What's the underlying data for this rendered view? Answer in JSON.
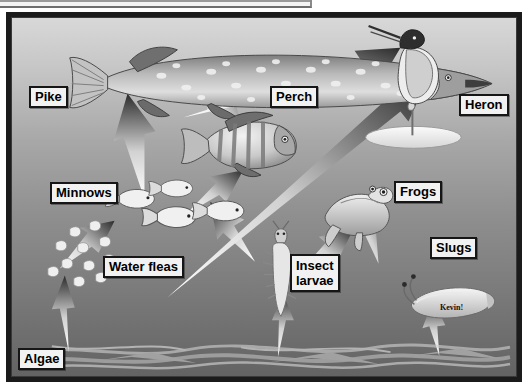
{
  "diagram": {
    "signature": "Kevin!",
    "background": {
      "water_top_color": "#d8d8d8",
      "water_bottom_color": "#636363",
      "frame_color": "#1b1b1b"
    },
    "organisms": [
      {
        "id": "pike",
        "label": "Pike",
        "x": 29,
        "y": 86,
        "role": "top predator fish"
      },
      {
        "id": "perch",
        "label": "Perch",
        "x": 270,
        "y": 86,
        "role": "predator fish"
      },
      {
        "id": "heron",
        "label": "Heron",
        "x": 459,
        "y": 94,
        "role": "bird predator"
      },
      {
        "id": "minnows",
        "label": "Minnows",
        "x": 50,
        "y": 182,
        "role": "small fish"
      },
      {
        "id": "frogs",
        "label": "Frogs",
        "x": 394,
        "y": 181,
        "role": "amphibian"
      },
      {
        "id": "water-fleas",
        "label": "Water fleas",
        "x": 103,
        "y": 256,
        "role": "zooplankton"
      },
      {
        "id": "insect-larvae",
        "label": "Insect\nlarvae",
        "x": 290,
        "y": 254,
        "role": "invertebrate"
      },
      {
        "id": "slugs",
        "label": "Slugs",
        "x": 430,
        "y": 237,
        "role": "invertebrate"
      },
      {
        "id": "algae",
        "label": "Algae",
        "x": 18,
        "y": 348,
        "role": "producer"
      }
    ],
    "arrows": [
      {
        "from": "algae",
        "to": "water-fleas"
      },
      {
        "from": "water-fleas",
        "to": "minnows"
      },
      {
        "from": "minnows",
        "to": "pike"
      },
      {
        "from": "minnows",
        "to": "perch"
      },
      {
        "from": "perch",
        "to": "pike"
      },
      {
        "from": "perch",
        "to": "heron"
      },
      {
        "from": "algae",
        "to": "insect-larvae"
      },
      {
        "from": "insect-larvae",
        "to": "minnows"
      },
      {
        "from": "insect-larvae",
        "to": "frogs"
      },
      {
        "from": "frogs",
        "to": "heron"
      },
      {
        "from": "algae",
        "to": "slugs"
      },
      {
        "from": "slugs",
        "to": "frogs"
      }
    ],
    "arrow_style": {
      "tail_color": "#ffffff",
      "head_color": "#2b2b2b",
      "description": "tapered arrow, white at tail fading to near-black at the arrowhead"
    }
  }
}
